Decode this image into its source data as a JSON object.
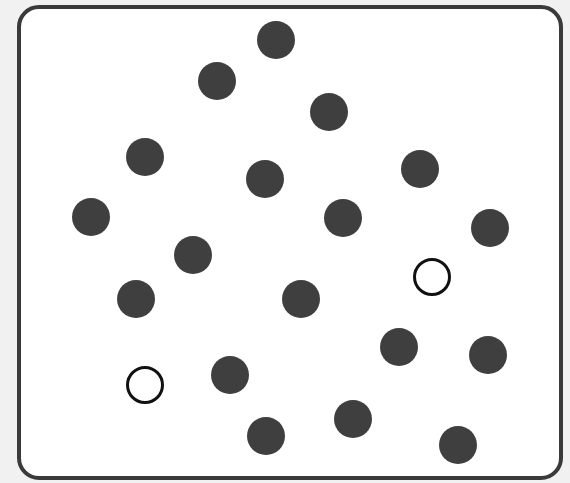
{
  "diagram": {
    "type": "dot-pattern",
    "frame": {
      "left": 17,
      "top": 5,
      "right": 563,
      "bottom": 480,
      "border_color": "#3a3a3a"
    },
    "colors": {
      "filled": "#3f3f3f",
      "open_stroke": "#111111",
      "background": "#ffffff"
    },
    "radius": 19,
    "filled_count": 18,
    "open_count": 2,
    "dots": [
      {
        "x": 276,
        "y": 40,
        "kind": "filled"
      },
      {
        "x": 217,
        "y": 81,
        "kind": "filled"
      },
      {
        "x": 329,
        "y": 112,
        "kind": "filled"
      },
      {
        "x": 145,
        "y": 157,
        "kind": "filled"
      },
      {
        "x": 265,
        "y": 179,
        "kind": "filled"
      },
      {
        "x": 420,
        "y": 169,
        "kind": "filled"
      },
      {
        "x": 91,
        "y": 217,
        "kind": "filled"
      },
      {
        "x": 343,
        "y": 218,
        "kind": "filled"
      },
      {
        "x": 490,
        "y": 228,
        "kind": "filled"
      },
      {
        "x": 193,
        "y": 255,
        "kind": "filled"
      },
      {
        "x": 432,
        "y": 277,
        "kind": "open"
      },
      {
        "x": 136,
        "y": 299,
        "kind": "filled"
      },
      {
        "x": 301,
        "y": 299,
        "kind": "filled"
      },
      {
        "x": 399,
        "y": 347,
        "kind": "filled"
      },
      {
        "x": 488,
        "y": 355,
        "kind": "filled"
      },
      {
        "x": 230,
        "y": 375,
        "kind": "filled"
      },
      {
        "x": 145,
        "y": 385,
        "kind": "open"
      },
      {
        "x": 353,
        "y": 419,
        "kind": "filled"
      },
      {
        "x": 266,
        "y": 436,
        "kind": "filled"
      },
      {
        "x": 458,
        "y": 445,
        "kind": "filled"
      }
    ]
  }
}
